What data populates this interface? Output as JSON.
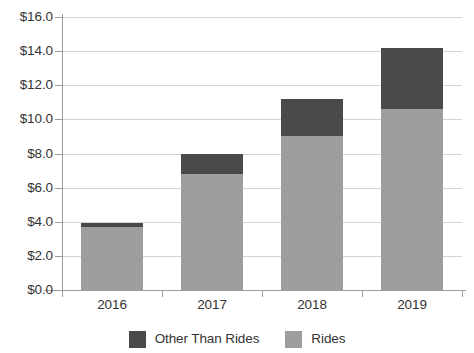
{
  "chart_data": {
    "type": "bar",
    "title": "",
    "subtitle": "",
    "xlabel": "",
    "ylabel": "",
    "stacked": true,
    "orientation": "vertical",
    "grid": true,
    "grid_axis": "y",
    "legend_position": "bottom",
    "categories": [
      "2016",
      "2017",
      "2018",
      "2019"
    ],
    "ylim": [
      0,
      16
    ],
    "ytick_values": [
      0,
      2,
      4,
      6,
      8,
      10,
      12,
      14,
      16
    ],
    "ytick_labels": [
      "$0.0",
      "$2.0",
      "$4.0",
      "$6.0",
      "$8.0",
      "$10.0",
      "$12.0",
      "$14.0",
      "$16.0"
    ],
    "series": [
      {
        "name": "Rides",
        "color": "#9e9e9e",
        "values": [
          3.7,
          6.8,
          9.0,
          10.6
        ]
      },
      {
        "name": "Other Than Rides",
        "color": "#4a4a4a",
        "values": [
          0.2,
          1.2,
          2.2,
          3.6
        ]
      }
    ],
    "totals": [
      3.9,
      8.0,
      11.2,
      14.2
    ],
    "legend": [
      {
        "label": "Other Than Rides",
        "color": "#4a4a4a"
      },
      {
        "label": "Rides",
        "color": "#9e9e9e"
      }
    ]
  },
  "colors": {
    "rides": "#9e9e9e",
    "other_than_rides": "#4a4a4a",
    "gridline": "#d4d4d4",
    "axis": "#9b9b9b",
    "text": "#333333",
    "background": "#ffffff"
  }
}
